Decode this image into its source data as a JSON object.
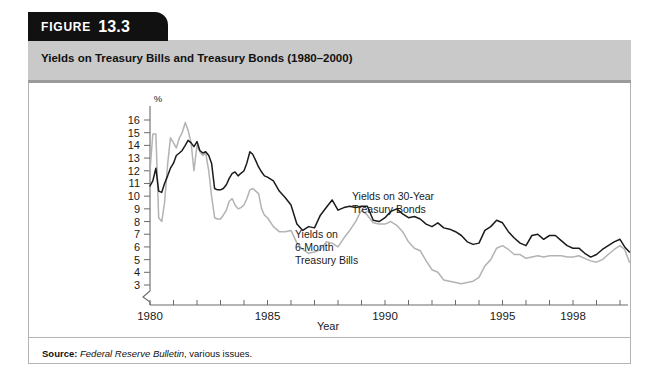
{
  "figure": {
    "badge_word": "FIGURE",
    "badge_number": "13.3",
    "title": "Yields on Treasury Bills and Treasury Bonds (1980–2000)"
  },
  "source": {
    "label": "Source:",
    "publication": "Federal Reserve Bulletin",
    "trailing": ", various issues."
  },
  "annotations": {
    "bonds_line1": "Yields on 30-Year",
    "bonds_line2": "Treasury Bonds",
    "bills_line1": "Yields on",
    "bills_line2": "6-Month",
    "bills_line3": "Treasury Bills"
  },
  "colors": {
    "bonds": "#1b1b1b",
    "bills": "#b3b3b3",
    "axis": "#6b6b6b",
    "title_band": "#c9c9c9",
    "tab": "#111111",
    "card_border": "#b4b4b4"
  },
  "chart_data": {
    "type": "line",
    "title": "Yields on Treasury Bills and Treasury Bonds (1980–2000)",
    "xlabel": "Year",
    "ylabel": "%",
    "xlim": [
      1980,
      2000
    ],
    "ylim": [
      3,
      16
    ],
    "y_axis_break_below": 3,
    "grid": false,
    "legend": "inline-annotations",
    "ytick_labels": [
      "16",
      "15",
      "14",
      "13",
      "12",
      "11",
      "10",
      "9",
      "8",
      "7",
      "6",
      "5",
      "4",
      "3"
    ],
    "ytick_values": [
      16,
      15,
      14,
      13,
      12,
      11,
      10,
      9,
      8,
      7,
      6,
      5,
      4,
      3
    ],
    "xtick_labels": [
      "1980",
      "1985",
      "1990",
      "1995",
      "1998"
    ],
    "xtick_values": [
      1980,
      1985,
      1990,
      1995,
      1998
    ],
    "xticks_minor_every": 1,
    "series": [
      {
        "name": "Yields on 30-Year Treasury Bonds",
        "color": "#1b1b1b",
        "x": [
          1980.0,
          1980.12,
          1980.25,
          1980.37,
          1980.5,
          1980.62,
          1980.75,
          1980.87,
          1981.0,
          1981.12,
          1981.25,
          1981.37,
          1981.5,
          1981.62,
          1981.75,
          1981.87,
          1982.0,
          1982.12,
          1982.25,
          1982.37,
          1982.5,
          1982.62,
          1982.75,
          1982.87,
          1983.0,
          1983.12,
          1983.25,
          1983.37,
          1983.5,
          1983.62,
          1983.75,
          1983.87,
          1984.0,
          1984.12,
          1984.25,
          1984.37,
          1984.5,
          1984.62,
          1984.75,
          1984.87,
          1985.0,
          1985.25,
          1985.5,
          1985.75,
          1986.0,
          1986.25,
          1986.5,
          1986.75,
          1987.0,
          1987.25,
          1987.5,
          1987.75,
          1988.0,
          1988.25,
          1988.5,
          1988.75,
          1989.0,
          1989.25,
          1989.5,
          1989.75,
          1990.0,
          1990.25,
          1990.5,
          1990.75,
          1991.0,
          1991.25,
          1991.5,
          1991.75,
          1992.0,
          1992.25,
          1992.5,
          1992.75,
          1993.0,
          1993.25,
          1993.5,
          1993.75,
          1994.0,
          1994.25,
          1994.5,
          1994.75,
          1995.0,
          1995.25,
          1995.5,
          1995.75,
          1996.0,
          1996.25,
          1996.5,
          1996.75,
          1997.0,
          1997.25,
          1997.5,
          1997.75,
          1998.0,
          1998.25,
          1998.5,
          1998.75,
          1999.0,
          1999.25,
          1999.5,
          1999.75,
          2000.0,
          2000.2,
          2000.4
        ],
        "y": [
          10.8,
          11.2,
          12.2,
          10.4,
          10.3,
          11.0,
          11.6,
          12.2,
          12.6,
          13.2,
          13.4,
          13.6,
          14.0,
          14.4,
          14.2,
          13.9,
          14.3,
          13.6,
          13.4,
          13.5,
          13.2,
          12.6,
          10.6,
          10.5,
          10.5,
          10.6,
          10.9,
          11.4,
          11.8,
          11.9,
          11.6,
          11.8,
          12.0,
          12.6,
          13.5,
          13.3,
          12.8,
          12.3,
          11.9,
          11.6,
          11.5,
          11.2,
          10.4,
          9.9,
          9.3,
          7.8,
          7.3,
          7.6,
          7.5,
          8.5,
          9.1,
          9.7,
          8.9,
          9.1,
          9.2,
          9.1,
          9.2,
          9.2,
          8.1,
          8.0,
          8.3,
          8.8,
          9.0,
          8.6,
          8.3,
          8.4,
          8.2,
          7.8,
          7.6,
          7.9,
          7.5,
          7.4,
          7.2,
          6.9,
          6.4,
          6.2,
          6.3,
          7.3,
          7.6,
          8.1,
          7.9,
          7.2,
          6.7,
          6.3,
          6.1,
          6.9,
          7.0,
          6.6,
          6.9,
          6.9,
          6.5,
          6.1,
          5.9,
          5.9,
          5.5,
          5.2,
          5.4,
          5.8,
          6.1,
          6.4,
          6.6,
          6.0,
          5.6
        ]
      },
      {
        "name": "Yields on 6-Month Treasury Bills",
        "color": "#b3b3b3",
        "x": [
          1980.0,
          1980.12,
          1980.25,
          1980.37,
          1980.5,
          1980.62,
          1980.75,
          1980.87,
          1981.0,
          1981.12,
          1981.25,
          1981.37,
          1981.5,
          1981.62,
          1981.75,
          1981.87,
          1982.0,
          1982.12,
          1982.25,
          1982.37,
          1982.5,
          1982.62,
          1982.75,
          1982.87,
          1983.0,
          1983.12,
          1983.25,
          1983.37,
          1983.5,
          1983.62,
          1983.75,
          1983.87,
          1984.0,
          1984.12,
          1984.25,
          1984.37,
          1984.5,
          1984.62,
          1984.75,
          1984.87,
          1985.0,
          1985.25,
          1985.5,
          1985.75,
          1986.0,
          1986.25,
          1986.5,
          1986.75,
          1987.0,
          1987.25,
          1987.5,
          1987.75,
          1988.0,
          1988.25,
          1988.5,
          1988.75,
          1989.0,
          1989.25,
          1989.5,
          1989.75,
          1990.0,
          1990.25,
          1990.5,
          1990.75,
          1991.0,
          1991.25,
          1991.5,
          1991.75,
          1992.0,
          1992.25,
          1992.5,
          1992.75,
          1993.0,
          1993.25,
          1993.5,
          1993.75,
          1994.0,
          1994.25,
          1994.5,
          1994.75,
          1995.0,
          1995.25,
          1995.5,
          1995.75,
          1996.0,
          1996.25,
          1996.5,
          1996.75,
          1997.0,
          1997.25,
          1997.5,
          1997.75,
          1998.0,
          1998.25,
          1998.5,
          1998.75,
          1999.0,
          1999.25,
          1999.5,
          1999.75,
          2000.0,
          2000.2,
          2000.4
        ],
        "y": [
          12.0,
          14.9,
          14.9,
          8.3,
          8.0,
          9.5,
          12.5,
          14.6,
          14.2,
          13.8,
          14.6,
          15.0,
          15.8,
          15.2,
          14.2,
          12.0,
          14.0,
          13.5,
          13.2,
          13.4,
          12.0,
          10.0,
          8.3,
          8.2,
          8.2,
          8.5,
          8.9,
          9.6,
          9.8,
          9.3,
          9.0,
          9.1,
          9.3,
          9.8,
          10.5,
          10.6,
          10.4,
          10.2,
          9.0,
          8.5,
          8.3,
          7.6,
          7.2,
          7.2,
          7.3,
          6.3,
          5.8,
          5.5,
          5.6,
          5.8,
          6.4,
          6.3,
          6.0,
          6.7,
          7.3,
          8.0,
          8.9,
          8.5,
          7.9,
          7.8,
          7.8,
          8.0,
          7.7,
          7.2,
          6.4,
          5.9,
          5.7,
          4.9,
          4.2,
          4.0,
          3.4,
          3.3,
          3.2,
          3.1,
          3.2,
          3.3,
          3.6,
          4.5,
          5.0,
          5.9,
          6.1,
          5.8,
          5.4,
          5.4,
          5.1,
          5.2,
          5.3,
          5.2,
          5.3,
          5.3,
          5.3,
          5.2,
          5.2,
          5.3,
          5.1,
          4.9,
          4.8,
          5.0,
          5.4,
          5.8,
          6.1,
          5.8,
          4.8
        ]
      }
    ]
  }
}
